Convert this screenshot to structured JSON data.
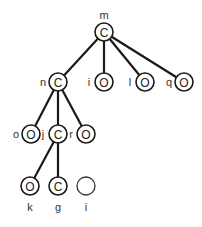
{
  "diagram": {
    "type": "tree",
    "nodes": [
      {
        "id": "m",
        "label": "m",
        "glyph": "C",
        "x": 104,
        "y": 32,
        "label_pos": "above"
      },
      {
        "id": "n",
        "label": "n",
        "glyph": "C",
        "x": 58,
        "y": 82,
        "label_pos": "left"
      },
      {
        "id": "i1",
        "label": "i",
        "glyph": "O",
        "x": 104,
        "y": 82,
        "label_pos": "left"
      },
      {
        "id": "l",
        "label": "l",
        "glyph": "O",
        "x": 145,
        "y": 82,
        "label_pos": "left"
      },
      {
        "id": "q",
        "label": "q",
        "glyph": "O",
        "x": 184,
        "y": 82,
        "label_pos": "left"
      },
      {
        "id": "o",
        "label": "o",
        "glyph": "O",
        "x": 31,
        "y": 134,
        "label_pos": "left"
      },
      {
        "id": "j",
        "label": "j",
        "glyph": "C",
        "x": 58,
        "y": 134,
        "label_pos": "left"
      },
      {
        "id": "r",
        "label": "r",
        "glyph": "O",
        "x": 86,
        "y": 134,
        "label_pos": "left"
      },
      {
        "id": "k",
        "label": "k",
        "glyph": "O",
        "x": 30,
        "y": 186,
        "label_pos": "below"
      },
      {
        "id": "g",
        "label": "g",
        "glyph": "C",
        "x": 58,
        "y": 186,
        "label_pos": "below"
      },
      {
        "id": "i2",
        "label": "i",
        "glyph": "",
        "x": 86,
        "y": 186,
        "label_pos": "below"
      }
    ],
    "edges": [
      [
        "m",
        "n"
      ],
      [
        "m",
        "i1"
      ],
      [
        "m",
        "l"
      ],
      [
        "m",
        "q"
      ],
      [
        "n",
        "o"
      ],
      [
        "n",
        "j"
      ],
      [
        "n",
        "r"
      ],
      [
        "j",
        "k"
      ],
      [
        "j",
        "g"
      ]
    ]
  }
}
